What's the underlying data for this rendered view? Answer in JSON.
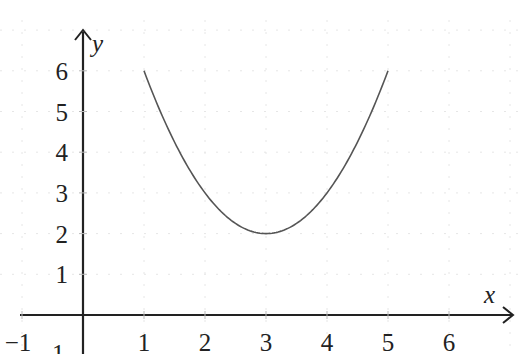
{
  "chart_data": {
    "type": "line",
    "title": "",
    "xlabel": "x",
    "ylabel": "y",
    "function": "y = (x - 3)^2 + 2",
    "xlim": [
      -1.3,
      7.1
    ],
    "ylim": [
      -1,
      7.1
    ],
    "x_ticks": [
      -1,
      1,
      2,
      3,
      4,
      5,
      6
    ],
    "x_tick_labels": [
      "−1",
      "1",
      "2",
      "3",
      "4",
      "5",
      "6"
    ],
    "y_ticks": [
      1,
      2,
      3,
      4,
      5,
      6
    ],
    "y_tick_labels": [
      "1",
      "2",
      "3",
      "4",
      "5",
      "6"
    ],
    "grid": true,
    "legend": null,
    "series": [
      {
        "name": "parabola",
        "x": [
          1,
          1.5,
          2,
          2.5,
          3,
          3.5,
          4,
          4.5,
          5
        ],
        "y": [
          6,
          4.25,
          3,
          2.25,
          2,
          2.25,
          3,
          4.25,
          6
        ]
      }
    ],
    "annotations": [
      "1 (partially visible near origin below x-axis)"
    ],
    "colors": {
      "curve": "#555555",
      "axes": "#222222",
      "grid": "#e6e6e6"
    }
  }
}
